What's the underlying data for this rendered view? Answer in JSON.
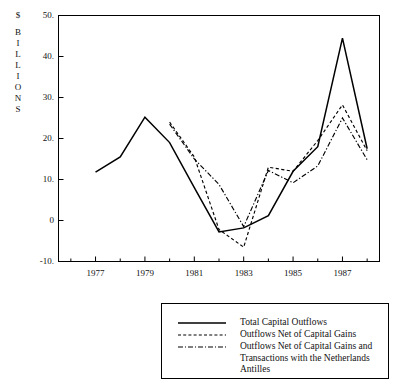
{
  "chart_data": {
    "type": "line",
    "title": "",
    "xlabel": "",
    "ylabel": "$ BILLIONS",
    "ylabel_chars": [
      "$",
      "B",
      "I",
      "L",
      "L",
      "I",
      "O",
      "N",
      "S"
    ],
    "xlim": [
      1975.5,
      1988.5
    ],
    "ylim": [
      -10,
      50
    ],
    "grid": false,
    "legend_position": "below-right",
    "ytick_labels": [
      "50.",
      "40.",
      "30.",
      "20.",
      "10.",
      "0",
      "-10."
    ],
    "ytick_values": [
      50,
      40,
      30,
      20,
      10,
      0,
      -10
    ],
    "xtick_labels": [
      "1977",
      "1979",
      "1981",
      "1983",
      "1985",
      "1987"
    ],
    "xtick_values": [
      1977,
      1979,
      1981,
      1983,
      1985,
      1987
    ],
    "xminor_values": [
      1976,
      1978,
      1980,
      1982,
      1984,
      1986,
      1988
    ],
    "series": [
      {
        "name": "Total Capital Outflows",
        "style": "solid",
        "x": [
          1977,
          1978,
          1979,
          1980,
          1981,
          1982,
          1983,
          1984,
          1985,
          1986,
          1987,
          1988
        ],
        "values": [
          11.8,
          15.5,
          25.2,
          19.0,
          8.0,
          -2.8,
          -1.8,
          1.2,
          12.0,
          18.0,
          44.5,
          17.5
        ]
      },
      {
        "name": "Outflows Net of Capital Gains",
        "style": "dashed",
        "x": [
          1980,
          1981,
          1982,
          1983,
          1984,
          1985,
          1986,
          1987,
          1988
        ],
        "values": [
          24.0,
          15.5,
          -2.2,
          -6.5,
          13.0,
          12.0,
          19.5,
          28.2,
          17.0
        ]
      },
      {
        "name": "Outflows Net of Capital Gains and Transactions with the Netherlands Antilles",
        "style": "dashdot",
        "x": [
          1980,
          1981,
          1982,
          1983,
          1984,
          1985,
          1986,
          1987,
          1988
        ],
        "values": [
          23.5,
          15.0,
          8.8,
          -1.5,
          12.2,
          9.2,
          13.3,
          25.0,
          14.8
        ]
      }
    ]
  },
  "legend": {
    "entries": [
      {
        "label": "Total Capital Outflows",
        "style": "solid"
      },
      {
        "label": "Outflows Net of Capital Gains",
        "style": "dashed"
      },
      {
        "label": "Outflows Net of Capital Gains and Transactions with the Netherlands Antilles",
        "style": "dashdot"
      }
    ]
  },
  "colors": {
    "line": "#000000",
    "axis": "#000000",
    "background": "#ffffff"
  }
}
